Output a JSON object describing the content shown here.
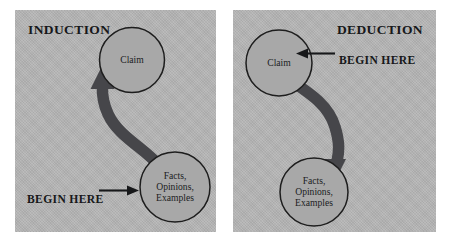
{
  "figure": {
    "background_color": "#ffffff",
    "panel_color": "#b4b4b4",
    "circle_fill": "#a8a8a8",
    "circle_stroke": "#1d1d1d",
    "thick_arrow_color": "#46464a",
    "thin_arrow_color": "#17181a",
    "text_color": "#17181a"
  },
  "panels": [
    {
      "id": "induction",
      "title": "INDUCTION",
      "title_align": "left",
      "begin_here": {
        "label": "BEGIN HERE",
        "arrow_direction": "right",
        "points_to": "facts-circle"
      },
      "nodes": [
        {
          "id": "claim",
          "label": "Claim"
        },
        {
          "id": "facts",
          "label": "Facts,\nOpinions,\nExamples"
        }
      ],
      "flow": {
        "from": "facts",
        "to": "claim",
        "arrow_direction": "up",
        "description": "Curved thick arrow from Facts, Opinions, Examples up to Claim"
      }
    },
    {
      "id": "deduction",
      "title": "DEDUCTION",
      "title_align": "right",
      "begin_here": {
        "label": "BEGIN HERE",
        "arrow_direction": "left",
        "points_to": "claim-circle"
      },
      "nodes": [
        {
          "id": "claim",
          "label": "Claim"
        },
        {
          "id": "facts",
          "label": "Facts,\nOpinions,\nExamples"
        }
      ],
      "flow": {
        "from": "claim",
        "to": "facts",
        "arrow_direction": "down",
        "description": "Curved thick arrow from Claim down to Facts, Opinions, Examples"
      }
    }
  ]
}
